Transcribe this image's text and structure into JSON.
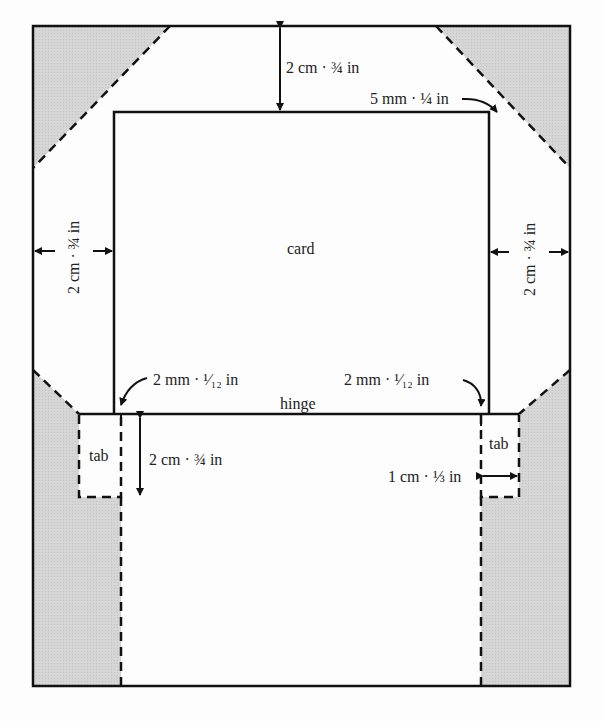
{
  "diagram": {
    "colors": {
      "line": "#111111",
      "shade": "#d4d4d4",
      "paper": "#fdfdfd"
    },
    "labels": {
      "card": "card",
      "hinge": "hinge",
      "tab_left": "tab",
      "tab_right": "tab",
      "top_margin": "2 cm · ¾ in",
      "corner_offset": "5 mm · ¼ in",
      "left_margin": "2 cm · ¾ in",
      "right_margin": "2 cm · ¾ in",
      "hinge_left_gap": "2 mm · ¹⁄₁₂ in",
      "hinge_right_gap": "2 mm · ¹⁄₁₂ in",
      "tab_height": "2 cm · ¾ in",
      "tab_width": "1 cm · ⅓ in"
    }
  }
}
